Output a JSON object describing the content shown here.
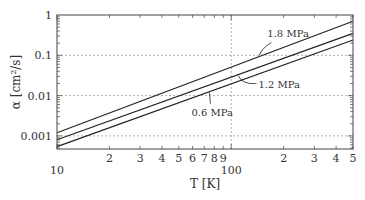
{
  "chart_data": {
    "type": "line",
    "title": "",
    "xlabel": "T [K]",
    "ylabel": "α [cm²/s]",
    "xscale": "log",
    "yscale": "log",
    "xlim": [
      10,
      500
    ],
    "ylim": [
      0.0005,
      1
    ],
    "x_ticks_major": [
      {
        "value": 10,
        "label": "10"
      },
      {
        "value": 100,
        "label": "100"
      }
    ],
    "x_ticks_minor_labels": [
      {
        "value": 20,
        "label": "2"
      },
      {
        "value": 30,
        "label": "3"
      },
      {
        "value": 40,
        "label": "4"
      },
      {
        "value": 50,
        "label": "5"
      },
      {
        "value": 60,
        "label": "6"
      },
      {
        "value": 70,
        "label": "7"
      },
      {
        "value": 80,
        "label": "8"
      },
      {
        "value": 90,
        "label": "9"
      },
      {
        "value": 200,
        "label": "2"
      },
      {
        "value": 300,
        "label": "3"
      },
      {
        "value": 400,
        "label": "4"
      },
      {
        "value": 500,
        "label": "5"
      }
    ],
    "y_ticks": [
      {
        "value": 1,
        "label": "1"
      },
      {
        "value": 0.1,
        "label": "0.1"
      },
      {
        "value": 0.01,
        "label": "0.01"
      },
      {
        "value": 0.001,
        "label": "0.001"
      }
    ],
    "grid": "dotted at major decades",
    "x": [
      10,
      500
    ],
    "series": [
      {
        "name": "1.8 MPa",
        "values": [
          0.0012,
          0.7
        ]
      },
      {
        "name": "1.2 MPa",
        "values": [
          0.0008,
          0.35
        ]
      },
      {
        "name": "0.6 MPa",
        "values": [
          0.00054,
          0.24
        ]
      }
    ],
    "annotations": [
      {
        "text": "1.8 MPa",
        "at_T": 145
      },
      {
        "text": "1.2 MPa",
        "at_T": 110
      },
      {
        "text": "0.6 MPa",
        "at_T": 75
      }
    ]
  }
}
